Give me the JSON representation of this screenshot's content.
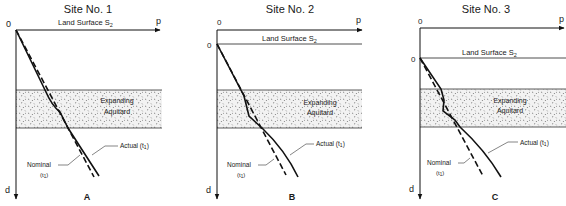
{
  "colors": {
    "ink": "#111111",
    "band_fill": "#ededed",
    "speckle": "#555555"
  },
  "panels": [
    {
      "id": "A",
      "title": "Site No. 1",
      "origin_label": "0",
      "x_axis_label": "p",
      "y_axis_label": "d",
      "land_surface_label": "Land Surface S",
      "land_surface_sub": "2",
      "surface_zero_label": "",
      "aquitard_line1": "Expanding",
      "aquitard_line2": "Aquitard",
      "actual_label": "Actual (t",
      "actual_sub": "1",
      "nominal_label": "Nominal",
      "nominal_time": "(t",
      "nominal_sub": "1",
      "panel_letter": "A"
    },
    {
      "id": "B",
      "title": "Site No. 2",
      "origin_label": "0",
      "x_axis_label": "p",
      "y_axis_label": "d",
      "land_surface_label": "Land Surface S",
      "land_surface_sub": "2",
      "surface_zero_label": "0",
      "aquitard_line1": "Expanding",
      "aquitard_line2": "Aquitard",
      "actual_label": "Actual (t",
      "actual_sub": "1",
      "nominal_label": "Nominal",
      "nominal_time": "(t",
      "nominal_sub": "1",
      "panel_letter": "B"
    },
    {
      "id": "C",
      "title": "Site No. 3",
      "origin_label": "0",
      "x_axis_label": "p",
      "y_axis_label": "d",
      "land_surface_label": "Land Surface S",
      "land_surface_sub": "2",
      "surface_zero_label": "0",
      "aquitard_line1": "Expanding",
      "aquitard_line2": "Aquitard",
      "actual_label": "Actual (t",
      "actual_sub": "1",
      "nominal_label": "Nominal",
      "nominal_time": "(t",
      "nominal_sub": "1",
      "panel_letter": "C"
    }
  ]
}
